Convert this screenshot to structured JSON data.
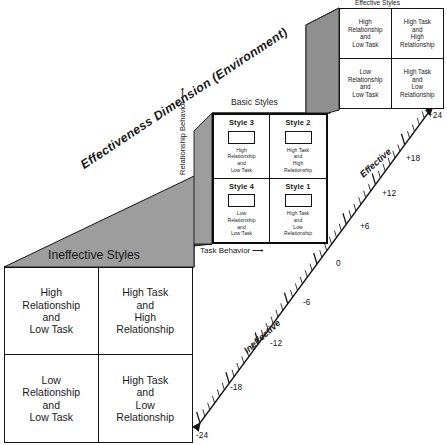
{
  "diagram": {
    "colors": {
      "shade_gray": "#9d9d9d",
      "shade_gray_dark": "#8f8f8f",
      "stroke": "#141414",
      "background": "#ffffff"
    }
  },
  "captions": {
    "basic_styles": "Basic Styles",
    "effective_styles": "Effective Styles",
    "ineffective_styles": "Ineffective Styles",
    "dimension": "Effectiveness Dimension (Environment)",
    "task_behavior": "Task Behavior",
    "task_behavior_arrow": "⟶",
    "relationship_behavior": "Relationship Behavior",
    "relationship_behavior_arrow": "↑",
    "effective_axis": "Effective",
    "ineffective_axis": "Ineffective"
  },
  "basic_styles": {
    "cells": [
      {
        "title": "Style 3",
        "desc_lines": [
          "High",
          "Relationship",
          "and",
          "Low Task"
        ]
      },
      {
        "title": "Style 2",
        "desc_lines": [
          "High Task",
          "and",
          "High",
          "Relationship"
        ]
      },
      {
        "title": "Style 4",
        "desc_lines": [
          "Low",
          "Relationship",
          "and",
          "Low Task"
        ]
      },
      {
        "title": "Style 1",
        "desc_lines": [
          "High Task",
          "and",
          "Low",
          "Relationship"
        ]
      }
    ]
  },
  "effective_styles": {
    "cells": [
      {
        "desc_lines": [
          "High",
          "Relationship",
          "and",
          "Low Task"
        ]
      },
      {
        "desc_lines": [
          "High Task",
          "and",
          "High",
          "Relationship"
        ]
      },
      {
        "desc_lines": [
          "Low",
          "Relationship",
          "and",
          "Low Task"
        ]
      },
      {
        "desc_lines": [
          "High Task",
          "and",
          "Low",
          "Relationship"
        ]
      }
    ]
  },
  "ineffective_styles": {
    "cells": [
      {
        "desc_lines": [
          "High",
          "Relationship",
          "and",
          "Low Task"
        ]
      },
      {
        "desc_lines": [
          "High Task",
          "and",
          "High",
          "Relationship"
        ]
      },
      {
        "desc_lines": [
          "Low",
          "Relationship",
          "and",
          "Low Task"
        ]
      },
      {
        "desc_lines": [
          "High Task",
          "and",
          "Low",
          "Relationship"
        ]
      }
    ]
  },
  "chart_data": {
    "type": "diagram-scale",
    "axis_label": "Effectiveness Dimension (Environment)",
    "effective_label": "Effective",
    "ineffective_label": "Ineffective",
    "tick_values": [
      -24,
      -18,
      -12,
      -6,
      0,
      6,
      12,
      18,
      24
    ],
    "tick_labels": [
      "-24",
      "-18",
      "-12",
      "-6",
      "0",
      "+6",
      "+12",
      "+18",
      "+24"
    ],
    "minor_ticks_between": 5,
    "range": [
      -24,
      24
    ],
    "zero_at": "Basic Styles plane"
  },
  "ticks": [
    {
      "label": "+24",
      "x": 428,
      "y": 110
    },
    {
      "label": "+18",
      "x": 406,
      "y": 153
    },
    {
      "label": "+12",
      "x": 382,
      "y": 188
    },
    {
      "label": "+6",
      "x": 360,
      "y": 221
    },
    {
      "label": "0",
      "x": 336,
      "y": 258
    },
    {
      "label": "-6",
      "x": 303,
      "y": 297
    },
    {
      "label": "-12",
      "x": 270,
      "y": 338
    },
    {
      "label": "-18",
      "x": 230,
      "y": 382
    },
    {
      "label": "-24",
      "x": 196,
      "y": 430
    }
  ]
}
